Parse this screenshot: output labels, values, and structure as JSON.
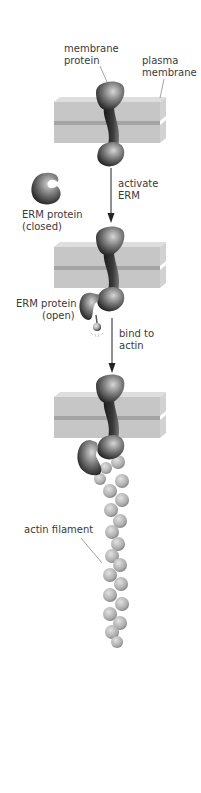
{
  "labels": {
    "membrane_protein": [
      "membrane",
      "protein"
    ],
    "plasma_membrane": [
      "plasma",
      "membrane"
    ],
    "erm_closed": [
      "ERM protein",
      "(closed)"
    ],
    "activate": [
      "activate",
      "ERM"
    ],
    "erm_open": [
      "ERM protein",
      "(open)"
    ],
    "bind": [
      "bind to",
      "actin"
    ],
    "actin_filament": "actin filament"
  },
  "colors": {
    "membrane_face": "#c9c9c9",
    "membrane_top": "#dcdcdc",
    "membrane_groove": "#9e9e9e",
    "protein_dark": "#1c1c1c",
    "protein_light": "#d0d0d0",
    "actin": "#b8b8b8",
    "text": "#3a3a3a"
  }
}
